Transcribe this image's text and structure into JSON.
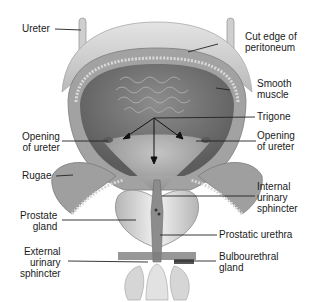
{
  "diagram": {
    "labels_left": [
      {
        "id": "ureter",
        "lines": [
          "Ureter"
        ]
      },
      {
        "id": "opening-of-ureter-left",
        "lines": [
          "Opening",
          "of ureter"
        ]
      },
      {
        "id": "rugae",
        "lines": [
          "Rugae"
        ]
      },
      {
        "id": "prostate-gland",
        "lines": [
          "Prostate",
          "gland"
        ]
      },
      {
        "id": "external-urinary-sphincter",
        "lines": [
          "External",
          "urinary",
          "sphincter"
        ]
      }
    ],
    "labels_right": [
      {
        "id": "cut-edge-of-peritoneum",
        "lines": [
          "Cut edge of",
          "peritoneum"
        ]
      },
      {
        "id": "smooth-muscle",
        "lines": [
          "Smooth",
          "muscle"
        ]
      },
      {
        "id": "trigone",
        "lines": [
          "Trigone"
        ]
      },
      {
        "id": "opening-of-ureter-right",
        "lines": [
          "Opening",
          "of ureter"
        ]
      },
      {
        "id": "internal-urinary-sphincter",
        "lines": [
          "Internal",
          "urinary",
          "sphincter"
        ]
      },
      {
        "id": "prostatic-urethra",
        "lines": [
          "Prostatic urethra"
        ]
      },
      {
        "id": "bulbourethral-gland",
        "lines": [
          "Bulbourethral",
          "gland"
        ]
      }
    ],
    "colors": {
      "background": "#ffffff",
      "tissue_dark": "#6e6e6e",
      "tissue_mid": "#9a9a9a",
      "tissue_light": "#d2d2d2",
      "peritoneum": "#c8c8c8",
      "leader_line": "#222222",
      "text": "#1a1a1a"
    }
  }
}
